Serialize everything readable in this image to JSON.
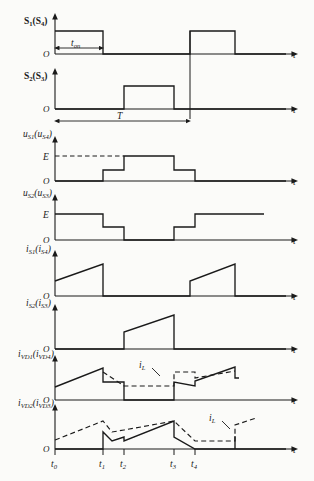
{
  "figure": {
    "type": "timing-waveform-diagram",
    "title": "",
    "axis_origin_label": "O",
    "time_axis_label": "t",
    "amplitude_label_E": "E",
    "period_label": "T",
    "on_time_label": "t",
    "on_time_sub": "on",
    "inductor_current_label": "i",
    "inductor_current_sub": "L",
    "time_markers": [
      {
        "label": "t",
        "sub": "0",
        "x": 55
      },
      {
        "label": "t",
        "sub": "1",
        "x": 103
      },
      {
        "label": "t",
        "sub": "2",
        "x": 124
      },
      {
        "label": "t",
        "sub": "3",
        "x": 174
      },
      {
        "label": "t",
        "sub": "4",
        "x": 195
      }
    ],
    "panels": [
      {
        "id": "s1s4",
        "name": "gate-signal-s1-s4",
        "label_main": "S",
        "label_main_sub": "1",
        "label_paren": "(S",
        "label_paren_sub": "4",
        "label_close": ")",
        "kind": "digital-pulse",
        "pulses": [
          [
            55,
            103
          ],
          [
            190,
            235
          ]
        ]
      },
      {
        "id": "s2s3",
        "name": "gate-signal-s2-s3",
        "label_main": "S",
        "label_main_sub": "2",
        "label_paren": "(S",
        "label_paren_sub": "3",
        "label_close": ")",
        "kind": "digital-pulse",
        "pulses": [
          [
            124,
            174
          ]
        ]
      },
      {
        "id": "us1",
        "name": "voltage-us1-us4",
        "label_main": "u",
        "label_main_sub": "S1",
        "label_paren": "(u",
        "label_paren_sub": "S4",
        "label_close": ")",
        "kind": "staircase",
        "levels": "0, E/2, E, E/2, 0"
      },
      {
        "id": "us2",
        "name": "voltage-us2-us3",
        "label_main": "u",
        "label_main_sub": "S2",
        "label_paren": "(u",
        "label_paren_sub": "S3",
        "label_close": ")",
        "kind": "staircase-inverted",
        "levels": "E, E/2, 0, E/2, E"
      },
      {
        "id": "is1",
        "name": "current-is1-is4",
        "label_main": "i",
        "label_main_sub": "S1",
        "label_paren": "(i",
        "label_paren_sub": "S4",
        "label_close": ")",
        "kind": "sawtooth"
      },
      {
        "id": "is2",
        "name": "current-is2-is3",
        "label_main": "i",
        "label_main_sub": "S2",
        "label_paren": "(i",
        "label_paren_sub": "S3",
        "label_close": ")",
        "kind": "sawtooth"
      },
      {
        "id": "ivd1",
        "name": "current-ivd1-ivd4",
        "label_main": "i",
        "label_main_sub": "VD1",
        "label_paren": "(i",
        "label_paren_sub": "VD4",
        "label_close": ")",
        "kind": "sawtooth-with-il-overlay",
        "has_il": true
      },
      {
        "id": "ivd2",
        "name": "current-ivd2-ivd3",
        "label_main": "i",
        "label_main_sub": "VD2",
        "label_paren": "(i",
        "label_paren_sub": "VD3",
        "label_close": ")",
        "kind": "sawtooth-with-il-overlay",
        "has_il": true,
        "has_time_markers": true
      }
    ]
  }
}
